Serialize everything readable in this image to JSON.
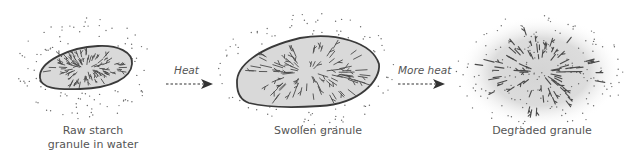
{
  "diagram": {
    "stages": [
      {
        "id": "raw",
        "label": "Raw starch\ngranule in water"
      },
      {
        "id": "swollen",
        "label": "Swollen granule"
      },
      {
        "id": "degraded",
        "label": "Degraded granule"
      }
    ],
    "arrows": [
      {
        "from": "raw",
        "to": "swollen",
        "label": "Heat"
      },
      {
        "from": "swollen",
        "to": "degraded",
        "label": "More heat"
      }
    ],
    "colors": {
      "granule_fill": "#d9d9d9",
      "granule_outline": "#3a3a3a",
      "strands": "#4a4a4a",
      "water_dots": "#6a6a6a",
      "text": "#555555",
      "arrow": "#333333"
    }
  }
}
